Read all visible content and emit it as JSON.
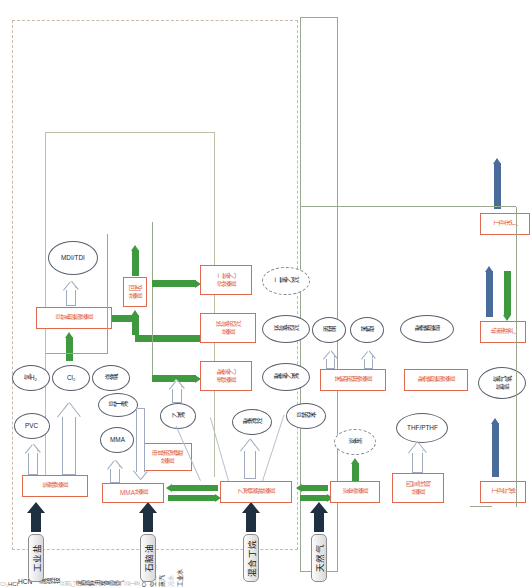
{
  "diagram": {
    "type": "process-flow"
  },
  "feedstocks": [
    {
      "id": "salt",
      "label": "工业盐"
    },
    {
      "id": "naphtha",
      "label": "石脑油"
    },
    {
      "id": "butane",
      "label": "混合丁烷"
    },
    {
      "id": "natgas",
      "label": "天然气"
    }
  ],
  "plants": [
    {
      "id": "chloralkali",
      "label": "氯碱装置"
    },
    {
      "id": "mma",
      "label": "MMA装置"
    },
    {
      "id": "mal",
      "label": "甲基丙烯醛\n装置"
    },
    {
      "id": "cracker",
      "label": "乙烯裂解装置"
    },
    {
      "id": "carbonblack",
      "label": "炭黑装置"
    },
    {
      "id": "thf",
      "label": "四氢呋喃\n装置"
    },
    {
      "id": "isocyanate",
      "label": "异氰酸酯装置"
    },
    {
      "id": "recovery",
      "label": "回收\n装置"
    },
    {
      "id": "pvcplant",
      "label": "聚氯乙\n烯装置"
    },
    {
      "id": "po",
      "label": "环氧丙烷\n装置"
    },
    {
      "id": "edc",
      "label": "二氯乙\n烷装置"
    },
    {
      "id": "phenolacetone",
      "label": "苯酚丙酮装置"
    },
    {
      "id": "pc",
      "label": "聚碳酸酯装置"
    },
    {
      "id": "indgas",
      "label": "工业气体"
    },
    {
      "id": "chp",
      "label": "热电联产"
    },
    {
      "id": "waterworks",
      "label": "工业水厂"
    }
  ],
  "products": [
    {
      "id": "pvc",
      "label": "PVC"
    },
    {
      "id": "h2",
      "label": "氢H₂"
    },
    {
      "id": "cl2",
      "label": "Cl₂"
    },
    {
      "id": "naoh",
      "label": "烧碱"
    },
    {
      "id": "mma_p",
      "label": "MMA"
    },
    {
      "id": "ib",
      "label": "异丁烯"
    },
    {
      "id": "ethylene",
      "label": "乙烯"
    },
    {
      "id": "polyolef",
      "label": "聚烯烃"
    },
    {
      "id": "cumene",
      "label": "异丙苯"
    },
    {
      "id": "cblack",
      "label": "炭黑"
    },
    {
      "id": "mditdi",
      "label": "MDI/TDI"
    },
    {
      "id": "pvc_p",
      "label": "聚氯乙烯"
    },
    {
      "id": "po_p",
      "label": "环氧丙烷"
    },
    {
      "id": "edc_p",
      "label": "二氯乙烷"
    },
    {
      "id": "acetone",
      "label": "丙酮"
    },
    {
      "id": "phenol",
      "label": "苯酚"
    },
    {
      "id": "thf_p",
      "label": "THF/PTHF"
    },
    {
      "id": "pc_p",
      "label": "聚碳酸酯"
    },
    {
      "id": "airgas",
      "label": "氮气氧\n氩氩"
    }
  ],
  "stream_labels": [
    {
      "id": "hcn",
      "label": "HCN、废硫铵"
    },
    {
      "id": "waste_oil",
      "label": "废裂解油"
    },
    {
      "id": "cb_tail",
      "label": "炭黑尾气"
    },
    {
      "id": "hcl",
      "label": "HCl"
    },
    {
      "id": "cl2_line",
      "label": "Cl₂"
    },
    {
      "id": "co_h2",
      "label": "CO、H₂"
    },
    {
      "id": "airsep",
      "label": "空分气体"
    },
    {
      "id": "steam",
      "label": "蒸汽"
    },
    {
      "id": "sewage",
      "label": "污水"
    },
    {
      "id": "indwater",
      "label": "工业水"
    },
    {
      "id": "butene",
      "label": "异丁烷"
    },
    {
      "id": "c3",
      "label": "丙烯"
    },
    {
      "id": "reuse",
      "label": "回用"
    },
    {
      "id": "c4",
      "label": "C₄"
    }
  ],
  "colors": {
    "plant_border": "#e06a50",
    "plant_text": "#e0603f",
    "product_border": "#5a5f6e",
    "feed_fill": "#d9d9d9",
    "navy_arrow": "#1f3043",
    "green_arrow": "#3f9a3f",
    "blue_arrow": "#4a6c9b",
    "boundary": "#c9b9a8"
  }
}
